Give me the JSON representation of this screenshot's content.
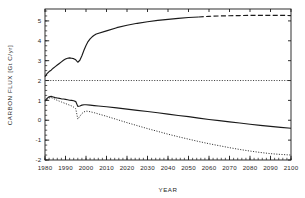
{
  "chart_data": {
    "type": "line",
    "title": "",
    "xlabel": "YEAR",
    "ylabel": "CARBON FLUX [Gt C/yr]",
    "xlim": [
      1980,
      2100
    ],
    "ylim": [
      -2,
      5.6
    ],
    "grid": false,
    "legend": "none",
    "xticks": [
      1980,
      1990,
      2000,
      2010,
      2020,
      2030,
      2040,
      2050,
      2060,
      2070,
      2080,
      2090,
      2100
    ],
    "xtick_labels": [
      "1980",
      "1990",
      "2000",
      "2010",
      "2020",
      "2030",
      "2040",
      "2050",
      "2060",
      "2070",
      "2080",
      "2090",
      "2100"
    ],
    "xminor_interval": 2,
    "yticks": [
      -2,
      -1,
      0,
      1,
      2,
      3,
      4,
      5
    ],
    "ytick_labels": [
      "-2",
      "-1",
      "0",
      "1",
      "2",
      "3",
      "4",
      "5"
    ],
    "yminor_interval": 0.25,
    "series": [
      {
        "name": "upper-flux-curve",
        "style": "solid-then-dashed",
        "dash_start_year": 2055,
        "color": "#1a1a1a",
        "x": [
          1980,
          1981,
          1982,
          1983,
          1984,
          1985,
          1986,
          1987,
          1988,
          1989,
          1990,
          1991,
          1992,
          1993,
          1994,
          1995,
          1996,
          1997,
          1998,
          1999,
          2000,
          2001,
          2002,
          2003,
          2004,
          2005,
          2010,
          2015,
          2020,
          2025,
          2030,
          2035,
          2040,
          2045,
          2050,
          2055,
          2060,
          2065,
          2070,
          2075,
          2080,
          2085,
          2090,
          2095,
          2100
        ],
        "y": [
          2.2,
          2.35,
          2.45,
          2.52,
          2.62,
          2.7,
          2.78,
          2.86,
          2.94,
          3.02,
          3.08,
          3.12,
          3.14,
          3.12,
          3.1,
          3.04,
          2.92,
          3.02,
          3.25,
          3.52,
          3.76,
          3.96,
          4.1,
          4.2,
          4.28,
          4.34,
          4.5,
          4.66,
          4.78,
          4.88,
          4.96,
          5.03,
          5.08,
          5.13,
          5.17,
          5.2,
          5.23,
          5.25,
          5.26,
          5.27,
          5.28,
          5.28,
          5.28,
          5.28,
          5.27
        ]
      },
      {
        "name": "reference-level-line",
        "style": "dotted",
        "color": "#3a3a3a",
        "x": [
          1980,
          2100
        ],
        "y": [
          2.0,
          2.0
        ]
      },
      {
        "name": "lower-solid-flux-curve",
        "style": "solid",
        "color": "#1a1a1a",
        "x": [
          1980,
          1981,
          1982,
          1983,
          1984,
          1985,
          1986,
          1987,
          1988,
          1989,
          1990,
          1991,
          1992,
          1993,
          1994,
          1995,
          1996,
          1997,
          1998,
          1999,
          2000,
          2002,
          2004,
          2006,
          2010,
          2015,
          2020,
          2025,
          2030,
          2035,
          2040,
          2045,
          2050,
          2055,
          2060,
          2065,
          2070,
          2075,
          2080,
          2085,
          2090,
          2095,
          2100
        ],
        "y": [
          0.98,
          1.1,
          1.18,
          1.2,
          1.17,
          1.14,
          1.12,
          1.1,
          1.08,
          1.07,
          1.05,
          1.03,
          1.01,
          1.0,
          0.98,
          0.94,
          0.7,
          0.72,
          0.76,
          0.78,
          0.78,
          0.76,
          0.74,
          0.72,
          0.68,
          0.62,
          0.56,
          0.5,
          0.44,
          0.38,
          0.31,
          0.24,
          0.18,
          0.11,
          0.04,
          -0.02,
          -0.08,
          -0.14,
          -0.2,
          -0.26,
          -0.31,
          -0.36,
          -0.4
        ]
      },
      {
        "name": "lower-dotted-flux-curve",
        "style": "dotted",
        "color": "#2a2a2a",
        "x": [
          1980,
          1981,
          1982,
          1983,
          1984,
          1985,
          1986,
          1987,
          1988,
          1989,
          1990,
          1991,
          1992,
          1993,
          1994,
          1995,
          1996,
          1997,
          1998,
          1999,
          2000,
          2001,
          2002,
          2004,
          2006,
          2010,
          2015,
          2020,
          2025,
          2030,
          2035,
          2040,
          2045,
          2050,
          2055,
          2060,
          2065,
          2070,
          2075,
          2080,
          2085,
          2090,
          2095,
          2100
        ],
        "y": [
          0.95,
          1.05,
          1.12,
          1.14,
          1.1,
          1.05,
          1.0,
          0.96,
          0.92,
          0.88,
          0.84,
          0.8,
          0.76,
          0.72,
          0.66,
          0.58,
          0.06,
          0.2,
          0.34,
          0.42,
          0.46,
          0.45,
          0.43,
          0.38,
          0.32,
          0.2,
          0.04,
          -0.12,
          -0.27,
          -0.42,
          -0.56,
          -0.7,
          -0.83,
          -0.95,
          -1.07,
          -1.18,
          -1.28,
          -1.38,
          -1.47,
          -1.55,
          -1.62,
          -1.68,
          -1.72,
          -1.75
        ]
      }
    ]
  }
}
